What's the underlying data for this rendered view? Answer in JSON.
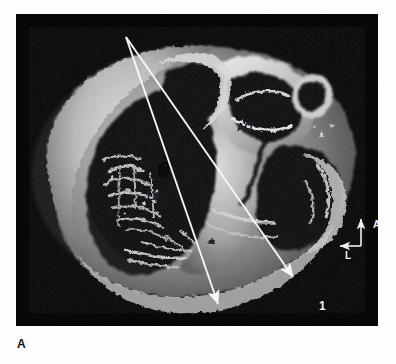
{
  "figure": {
    "panel_letter": "A",
    "plate_background_color": "#050505",
    "page_background_color": "#fdfdfd"
  },
  "photograph": {
    "kind": "anatomical-specimen-photograph",
    "subject": "transverse section of heart specimen",
    "rendering": "grayscale",
    "annotation_color": "#f7f7f7",
    "anatomical_labels": [
      {
        "id": "ao",
        "text": "AO",
        "x": 221,
        "y": 109,
        "color": "#111111"
      },
      {
        "id": "lv",
        "text": "LV",
        "x": 131,
        "y": 178,
        "color": "#111111"
      }
    ],
    "plane_markers": [
      {
        "id": "plane-1",
        "label": "1",
        "label_x": 303,
        "label_y": 286,
        "line": {
          "x1": 126,
          "y1": 37,
          "x2": 297,
          "y2": 283
        }
      },
      {
        "id": "plane-2",
        "label": "2",
        "label_x": 227,
        "label_y": 313,
        "line": {
          "x1": 126,
          "y1": 37,
          "x2": 222,
          "y2": 310
        }
      }
    ],
    "orientation_compass": {
      "anterior_label": "A",
      "left_label": "L",
      "corner_x": 361,
      "corner_y": 246,
      "anterior_tip_y": 216,
      "left_tip_x": 338
    }
  }
}
